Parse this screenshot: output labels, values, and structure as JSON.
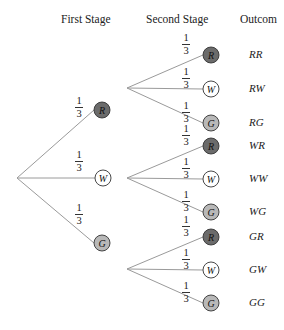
{
  "headers": {
    "first_stage": "First Stage",
    "second_stage": "Second Stage",
    "outcome": "Outcom"
  },
  "colors": {
    "red_fill": "#6b6b6b",
    "white_fill": "#ffffff",
    "green_fill": "#b8b8b8",
    "line": "#9a9a9a",
    "stroke": "#333333"
  },
  "root": {
    "x": 17,
    "y": 178
  },
  "first_stage": [
    {
      "label": "R",
      "prob_num": "1",
      "prob_den": "3",
      "x": 102,
      "y": 110,
      "fork": {
        "x": 127,
        "y": 88
      }
    },
    {
      "label": "W",
      "prob_num": "1",
      "prob_den": "3",
      "x": 103,
      "y": 178,
      "fork": {
        "x": 127,
        "y": 178
      }
    },
    {
      "label": "G",
      "prob_num": "1",
      "prob_den": "3",
      "x": 102,
      "y": 243,
      "fork": {
        "x": 127,
        "y": 269
      }
    }
  ],
  "second_stage": [
    {
      "label": "R",
      "prob_num": "1",
      "prob_den": "3",
      "outcome": "RR",
      "y": 55
    },
    {
      "label": "W",
      "prob_num": "1",
      "prob_den": "3",
      "outcome": "RW",
      "y": 89
    },
    {
      "label": "G",
      "prob_num": "1",
      "prob_den": "3",
      "outcome": "RG",
      "y": 123
    },
    {
      "label": "R",
      "prob_num": "1",
      "prob_den": "3",
      "outcome": "WR",
      "y": 146
    },
    {
      "label": "W",
      "prob_num": "1",
      "prob_den": "3",
      "outcome": "WW",
      "y": 179
    },
    {
      "label": "G",
      "prob_num": "1",
      "prob_den": "3",
      "outcome": "WG",
      "y": 212
    },
    {
      "label": "R",
      "prob_num": "1",
      "prob_den": "3",
      "outcome": "GR",
      "y": 237
    },
    {
      "label": "W",
      "prob_num": "1",
      "prob_den": "3",
      "outcome": "GW",
      "y": 270
    },
    {
      "label": "G",
      "prob_num": "1",
      "prob_den": "3",
      "outcome": "GG",
      "y": 303
    }
  ],
  "second_stage_x": 211,
  "outcome_x": 249
}
